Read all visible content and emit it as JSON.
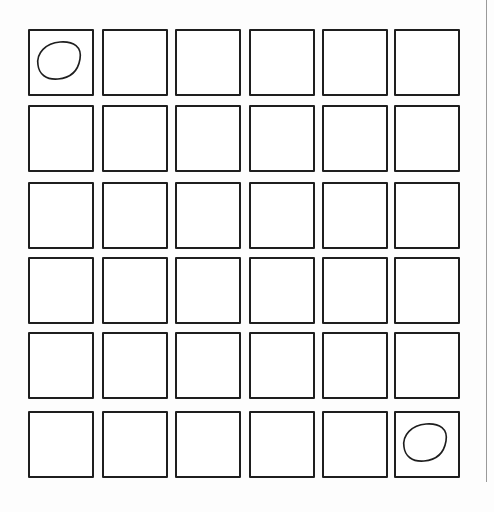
{
  "grid": {
    "rows": 6,
    "cols": 6,
    "col_x": [
      28,
      102,
      175,
      249,
      322,
      394
    ],
    "row_y": [
      29,
      105,
      182,
      257,
      332,
      411
    ],
    "cell_size": [
      66,
      67
    ],
    "border_color": "#1e1e1e",
    "marked_cells": [
      {
        "row": 0,
        "col": 0,
        "mark": "oval"
      },
      {
        "row": 5,
        "col": 5,
        "mark": "oval"
      }
    ]
  },
  "margin_line": {
    "x": 486,
    "color": "#9a9a9a"
  }
}
